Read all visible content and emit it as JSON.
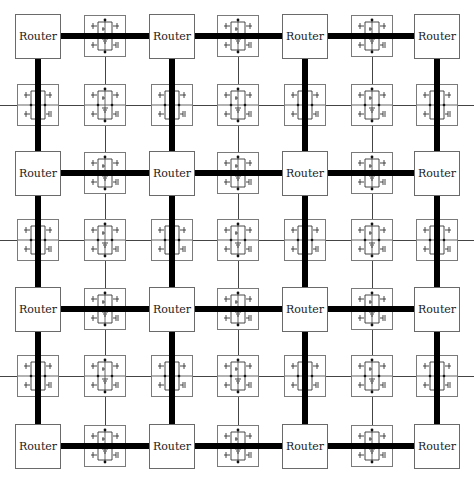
{
  "diagram": {
    "title": "",
    "grid_size": 7,
    "router_label": "Router",
    "colors": {
      "router_border": "#6a6a6a",
      "cell_border": "#7a7a7a",
      "thick_link": "#000000",
      "thin_wire": "#444444",
      "background": "#ffffff"
    },
    "column_centers": [
      38,
      105,
      172,
      238,
      305,
      372,
      437
    ],
    "row_centers": [
      36,
      105,
      173,
      240,
      309,
      376,
      446
    ],
    "routers": [
      {
        "row": 0,
        "col": 0,
        "label": "Router"
      },
      {
        "row": 0,
        "col": 2,
        "label": "Router"
      },
      {
        "row": 0,
        "col": 4,
        "label": "Router"
      },
      {
        "row": 0,
        "col": 6,
        "label": "Router"
      },
      {
        "row": 2,
        "col": 0,
        "label": "Router"
      },
      {
        "row": 2,
        "col": 2,
        "label": "Router"
      },
      {
        "row": 2,
        "col": 4,
        "label": "Router"
      },
      {
        "row": 2,
        "col": 6,
        "label": "Router"
      },
      {
        "row": 4,
        "col": 0,
        "label": "Router"
      },
      {
        "row": 4,
        "col": 2,
        "label": "Router"
      },
      {
        "row": 4,
        "col": 4,
        "label": "Router"
      },
      {
        "row": 4,
        "col": 6,
        "label": "Router"
      },
      {
        "row": 6,
        "col": 0,
        "label": "Router"
      },
      {
        "row": 6,
        "col": 2,
        "label": "Router"
      },
      {
        "row": 6,
        "col": 4,
        "label": "Router"
      },
      {
        "row": 6,
        "col": 6,
        "label": "Router"
      }
    ],
    "cell_type": "sram-cell-icon",
    "links": {
      "thick": "router-to-router mesh (horizontal on even rows, vertical on even columns)",
      "thin": "bitlines on odd columns, wordlines on odd rows"
    }
  }
}
